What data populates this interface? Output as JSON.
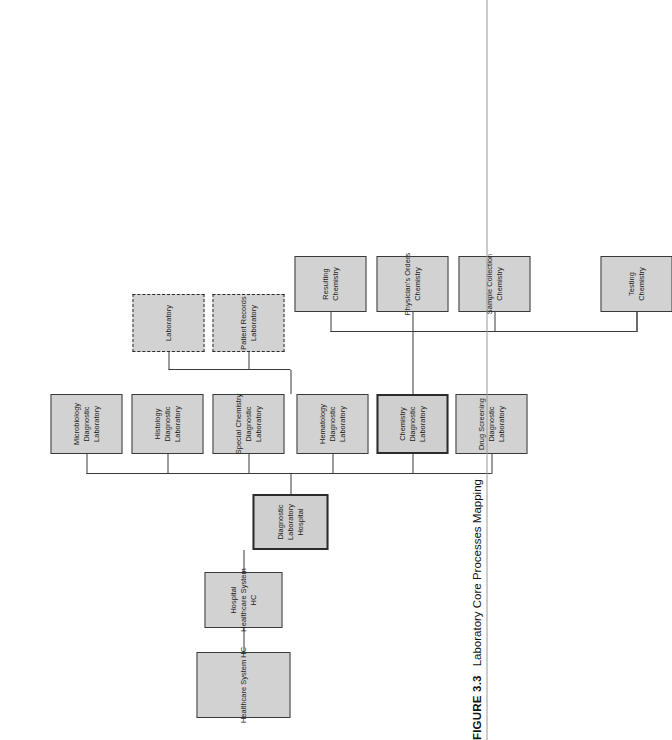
{
  "figure": {
    "number": "FIGURE 3.3",
    "caption": "Laboratory Core Processes Mapping"
  },
  "diagram": {
    "type": "tree-hierarchy-diagram",
    "root": {
      "id": "healthcare-system-hc",
      "lines": [
        "Healthcare System HC"
      ],
      "style": "solid"
    },
    "level2": {
      "id": "hospital-healthcare-system-hc",
      "lines": [
        "Hospital",
        "Healthcare System",
        "HC"
      ],
      "style": "solid"
    },
    "level3": {
      "id": "diagnostic-laboratory-hospital",
      "lines": [
        "Diagnostic",
        "Laboratory",
        "Hospital"
      ],
      "style": "emphasized"
    },
    "departments": [
      {
        "id": "drug-screening",
        "lines": [
          "Drug Screening",
          "Diagnostic",
          "Laboratory"
        ],
        "style": "solid"
      },
      {
        "id": "chemistry",
        "lines": [
          "Chemistry",
          "Diagnostic",
          "Laboratory"
        ],
        "style": "emphasized"
      },
      {
        "id": "hematology",
        "lines": [
          "Hematology",
          "Diagnostic",
          "Laboratory"
        ],
        "style": "solid"
      },
      {
        "id": "special-chemistry",
        "lines": [
          "Special Chemistry",
          "Diagnostic",
          "Laboratory"
        ],
        "style": "solid"
      },
      {
        "id": "histology",
        "lines": [
          "Histology",
          "Diagnostic",
          "Laboratory"
        ],
        "style": "solid"
      },
      {
        "id": "microbiology",
        "lines": [
          "Microbiology",
          "Diagnostic",
          "Laboratory"
        ],
        "style": "solid"
      }
    ],
    "support_units": [
      {
        "id": "patient-records",
        "lines": [
          "Patient Records",
          "Laboratory"
        ],
        "style": "dashed"
      },
      {
        "id": "laboratory",
        "lines": [
          "Laboratory"
        ],
        "style": "dashed"
      }
    ],
    "chemistry_processes": [
      {
        "id": "testing",
        "lines": [
          "Testing",
          "Chemistry"
        ],
        "style": "solid"
      },
      {
        "id": "sample-collection",
        "lines": [
          "Sample Collection",
          "Chemistry"
        ],
        "style": "solid"
      },
      {
        "id": "physicians-orders",
        "lines": [
          "Physician's Orders",
          "Chemistry"
        ],
        "style": "solid"
      },
      {
        "id": "resulting",
        "lines": [
          "Resulting",
          "Chemistry"
        ],
        "style": "solid"
      }
    ],
    "colors": {
      "box_fill": "#d2d2d2",
      "box_border": "#3a3a3a",
      "emphasized_border": "#2b2b2b",
      "connector": "#3a3a3a",
      "page_background": "#ffffff",
      "text": "#1a1a1a"
    }
  }
}
